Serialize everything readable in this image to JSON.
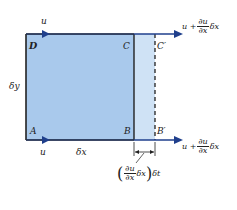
{
  "diagram": {
    "colors": {
      "fill_original": "#a9c9ec",
      "fill_extension": "#cfe2f5",
      "outline": "#222222",
      "arrow": "#1f3f8c"
    },
    "corners": {
      "A": "A",
      "B": "B",
      "C": "C",
      "D": "D",
      "B_prime": "B′",
      "C_prime": "C′"
    },
    "labels": {
      "top_left_velocity": "u",
      "bottom_left_velocity": "u",
      "height": "δy",
      "width": "δx",
      "right_velocity_prefix": "u +",
      "right_velocity_num": "∂u",
      "right_velocity_den": "∂x",
      "right_velocity_suffix": "δx",
      "displacement_num": "∂u",
      "displacement_den": "∂x",
      "displacement_inner_suffix": "δx",
      "displacement_outer_suffix": "δt",
      "paren_open": "(",
      "paren_close": ")"
    }
  }
}
